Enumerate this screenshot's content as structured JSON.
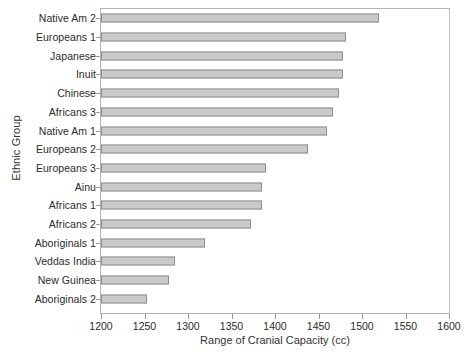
{
  "chart_data": {
    "type": "bar",
    "orientation": "horizontal",
    "title": "",
    "xlabel": "Range of Cranial Capacity (cc)",
    "ylabel": "Ethnic Group",
    "xlim": [
      1200,
      1600
    ],
    "xticks": [
      1200,
      1250,
      1300,
      1350,
      1400,
      1450,
      1500,
      1550,
      1600
    ],
    "grid": false,
    "legend": null,
    "bar_color": "#c9c9c9",
    "bar_border_color": "#8e8e8e",
    "categories": [
      "Native Am 2",
      "Europeans 1",
      "Japanese",
      "Inuit",
      "Chinese",
      "Africans 3",
      "Native Am 1",
      "Europeans 2",
      "Europeans 3",
      "Ainu",
      "Africans 1",
      "Africans 2",
      "Aboriginals 1",
      "Veddas India",
      "New Guinea",
      "Aboriginals 2"
    ],
    "values": [
      1520,
      1482,
      1478,
      1478,
      1473,
      1467,
      1460,
      1438,
      1390,
      1385,
      1385,
      1372,
      1320,
      1285,
      1278,
      1253
    ]
  }
}
